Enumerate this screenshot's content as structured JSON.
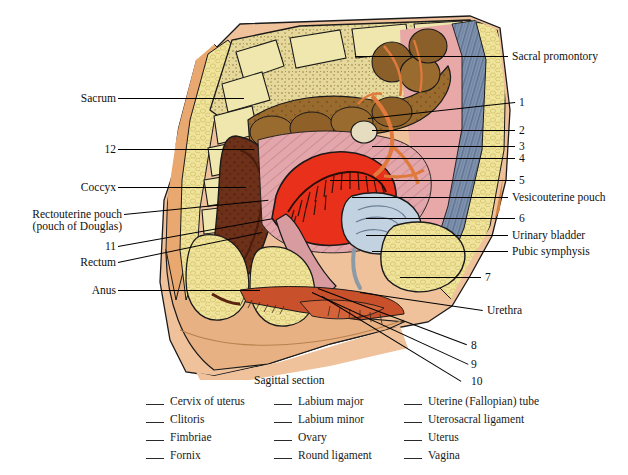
{
  "figure": {
    "caption": "Sagittal section",
    "left_labels": [
      {
        "id": "sacrum",
        "text": "Sacrum",
        "x": 68,
        "y": 92,
        "lineFrom": [
          118,
          98
        ],
        "lineTo": [
          243,
          98
        ]
      },
      {
        "id": "twelve",
        "text": "12",
        "x": 98,
        "y": 143,
        "lineFrom": [
          118,
          149
        ],
        "lineTo": [
          252,
          149
        ]
      },
      {
        "id": "coccyx",
        "text": "Coccyx",
        "x": 72,
        "y": 181,
        "lineFrom": [
          118,
          187
        ],
        "lineTo": [
          243,
          187
        ]
      },
      {
        "id": "rectouterine-pouch",
        "text": "Rectouterine pouch",
        "x": 18,
        "y": 208,
        "lineFrom": [
          124,
          214
        ],
        "lineTo": [
          268,
          200
        ]
      },
      {
        "id": "pouch-of-douglas",
        "text": "(pouch of Douglas)",
        "x": 18,
        "y": 220,
        "lineFrom": null,
        "lineTo": null
      },
      {
        "id": "eleven",
        "text": "11",
        "x": 98,
        "y": 240,
        "lineFrom": [
          118,
          246
        ],
        "lineTo": [
          272,
          218
        ]
      },
      {
        "id": "rectum",
        "text": "Rectum",
        "x": 70,
        "y": 256,
        "lineFrom": [
          118,
          262
        ],
        "lineTo": [
          262,
          232
        ]
      },
      {
        "id": "anus",
        "text": "Anus",
        "x": 84,
        "y": 284,
        "lineFrom": [
          118,
          290
        ],
        "lineTo": [
          258,
          290
        ]
      }
    ],
    "right_labels": [
      {
        "id": "sacral-promontory",
        "text": "Sacral promontory",
        "x": 512,
        "y": 50,
        "lineFrom": [
          508,
          56
        ],
        "lineTo": [
          355,
          56
        ]
      },
      {
        "id": "one",
        "text": "1",
        "x": 519,
        "y": 96,
        "lineFrom": [
          515,
          102
        ],
        "lineTo": [
          368,
          118
        ]
      },
      {
        "id": "two",
        "text": "2",
        "x": 519,
        "y": 124,
        "lineFrom": [
          515,
          130
        ],
        "lineTo": [
          372,
          130
        ]
      },
      {
        "id": "three",
        "text": "3",
        "x": 519,
        "y": 140,
        "lineFrom": [
          515,
          146
        ],
        "lineTo": [
          372,
          146
        ]
      },
      {
        "id": "four",
        "text": "4",
        "x": 519,
        "y": 152,
        "lineFrom": [
          515,
          158
        ],
        "lineTo": [
          372,
          158
        ]
      },
      {
        "id": "five",
        "text": "5",
        "x": 519,
        "y": 174,
        "lineFrom": [
          515,
          180
        ],
        "lineTo": [
          330,
          180
        ]
      },
      {
        "id": "vesicouterine-pouch",
        "text": "Vesicouterine pouch",
        "x": 512,
        "y": 191,
        "lineFrom": [
          508,
          197
        ],
        "lineTo": [
          352,
          197
        ]
      },
      {
        "id": "six",
        "text": "6",
        "x": 519,
        "y": 212,
        "lineFrom": [
          515,
          218
        ],
        "lineTo": [
          366,
          218
        ]
      },
      {
        "id": "urinary-bladder",
        "text": "Urinary bladder",
        "x": 512,
        "y": 229,
        "lineFrom": [
          508,
          235
        ],
        "lineTo": [
          366,
          235
        ]
      },
      {
        "id": "pubic-symphysis",
        "text": "Pubic symphysis",
        "x": 512,
        "y": 245,
        "lineFrom": [
          508,
          251
        ],
        "lineTo": [
          372,
          251
        ]
      },
      {
        "id": "seven",
        "text": "7",
        "x": 485,
        "y": 271,
        "lineFrom": [
          481,
          277
        ],
        "lineTo": [
          400,
          277
        ]
      },
      {
        "id": "urethra",
        "text": "Urethra",
        "x": 487,
        "y": 304,
        "lineFrom": [
          483,
          310
        ],
        "lineTo": [
          360,
          292
        ]
      },
      {
        "id": "eight",
        "text": "8",
        "x": 471,
        "y": 339,
        "lineFrom": [
          467,
          345
        ],
        "lineTo": [
          318,
          288
        ]
      },
      {
        "id": "nine",
        "text": "9",
        "x": 471,
        "y": 358,
        "lineFrom": [
          467,
          364
        ],
        "lineTo": [
          312,
          292
        ]
      },
      {
        "id": "ten",
        "text": "10",
        "x": 471,
        "y": 375,
        "lineFrom": [
          467,
          381
        ],
        "lineTo": [
          322,
          296
        ]
      }
    ]
  },
  "answer_bank": {
    "columns": [
      [
        "Cervix of uterus",
        "Clitoris",
        "Fimbriae",
        "Fornix"
      ],
      [
        "Labium major",
        "Labium minor",
        "Ovary",
        "Round ligament"
      ],
      [
        "Uterine (Fallopian) tube",
        "Uterosacral ligament",
        "Uterus",
        "Vagina"
      ]
    ]
  },
  "colors": {
    "skin": "#e8b183",
    "skin_light": "#f0c49c",
    "fat_yellow": "#f0e49a",
    "bone_cream": "#efe4a6",
    "pink_tissue": "#e8a8a8",
    "pink_pale": "#dfb4b8",
    "uterus_red": "#e8301a",
    "rectum_brown": "#7a3a22",
    "intestine_brown": "#9a6b2f",
    "tube_orange": "#e07a3c",
    "muscle_blue": "#7a8ba8",
    "bladder_blue": "#c2d2e0",
    "outline": "#1a1a1a"
  }
}
